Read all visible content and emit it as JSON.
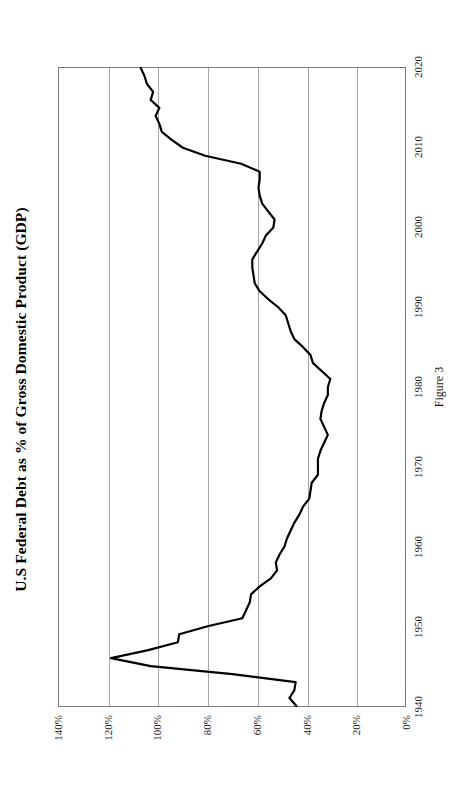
{
  "figure": {
    "title": "U.S Federal Debt as % of Gross Domestic Product (GDP)",
    "caption": "Figure 3",
    "line_color": "#000000",
    "grid_color": "#a6a6a6",
    "frame_color": "#7a7a7a",
    "background_color": "#ffffff",
    "orientation": "rotated-90-ccw"
  },
  "chart_data": {
    "type": "line",
    "title": "U.S Federal Debt as % of Gross Domestic Product (GDP)",
    "subtitle": "",
    "xlabel": "",
    "ylabel": "",
    "xlim": [
      1940,
      2020
    ],
    "ylim": [
      0,
      140
    ],
    "grid": true,
    "legend": "none",
    "xticks": [
      "1940",
      "1950",
      "1960",
      "1970",
      "1980",
      "1990",
      "2000",
      "2010",
      "2020"
    ],
    "yticks": [
      "0%",
      "20%",
      "40%",
      "60%",
      "80%",
      "100%",
      "120%",
      "140%"
    ],
    "x": [
      1940,
      1941,
      1942,
      1943,
      1944,
      1945,
      1946,
      1947,
      1948,
      1949,
      1950,
      1951,
      1952,
      1953,
      1954,
      1955,
      1956,
      1957,
      1958,
      1959,
      1960,
      1961,
      1962,
      1963,
      1964,
      1965,
      1966,
      1967,
      1968,
      1969,
      1970,
      1971,
      1972,
      1973,
      1974,
      1975,
      1976,
      1977,
      1978,
      1979,
      1980,
      1981,
      1982,
      1983,
      1984,
      1985,
      1986,
      1987,
      1988,
      1989,
      1990,
      1991,
      1992,
      1993,
      1994,
      1995,
      1996,
      1997,
      1998,
      1999,
      2000,
      2001,
      2002,
      2003,
      2004,
      2005,
      2006,
      2007,
      2008,
      2009,
      2010,
      2011,
      2012,
      2013,
      2014,
      2015,
      2016,
      2017,
      2018,
      2019,
      2020
    ],
    "values": [
      44.2,
      47.0,
      45.0,
      44.5,
      70.0,
      103.0,
      119.0,
      104.0,
      92.0,
      91.5,
      80.0,
      66.0,
      64.5,
      63.0,
      62.5,
      59.0,
      54.5,
      52.0,
      52.5,
      51.0,
      49.0,
      48.0,
      46.5,
      45.0,
      43.0,
      41.5,
      39.0,
      38.5,
      38.0,
      35.5,
      35.5,
      35.5,
      34.5,
      33.0,
      31.5,
      33.0,
      34.5,
      34.0,
      33.0,
      31.5,
      31.5,
      30.5,
      34.0,
      37.5,
      38.5,
      41.5,
      45.0,
      46.5,
      47.5,
      48.5,
      51.5,
      55.5,
      59.0,
      61.0,
      61.5,
      62.0,
      62.0,
      60.0,
      58.0,
      56.5,
      53.5,
      53.0,
      55.5,
      58.0,
      59.0,
      59.5,
      59.0,
      59.0,
      66.5,
      81.0,
      90.0,
      94.5,
      98.5,
      99.5,
      101.0,
      99.5,
      103.0,
      102.0,
      104.5,
      105.5,
      107.0
    ],
    "notes": {
      "peak": {
        "year": 1946,
        "value": 119.0
      },
      "trough": {
        "year": 1981,
        "value": 30.5
      }
    }
  }
}
